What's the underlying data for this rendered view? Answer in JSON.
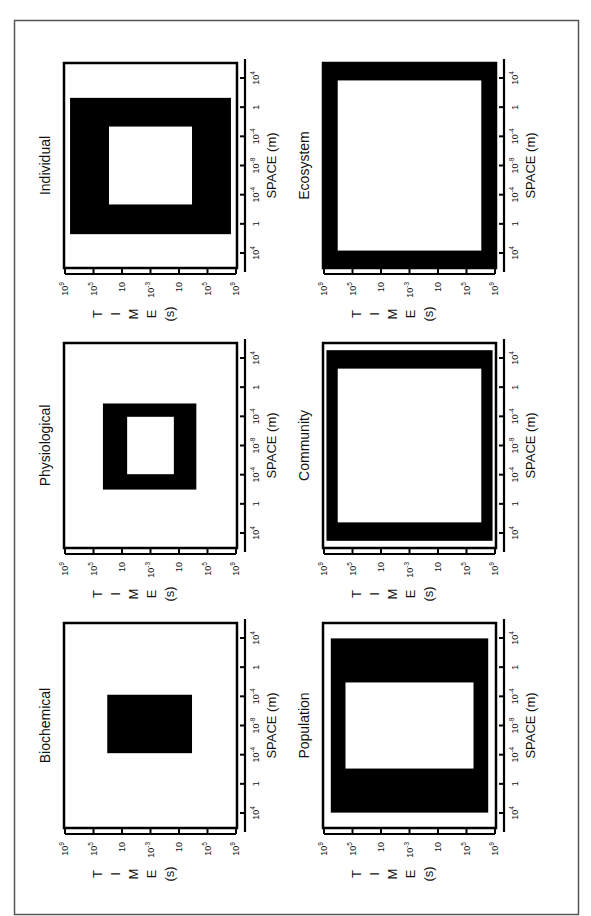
{
  "figure": {
    "orientation": "rotated-90-ccw",
    "frame_color": "#555555",
    "fill_color": "#000000",
    "background": "#ffffff"
  },
  "axes": {
    "time_label_letters": [
      "T",
      "I",
      "M",
      "E",
      "(s)"
    ],
    "time_label": "TIME (s)",
    "time_ticks": [
      {
        "base": "10",
        "exp": "9"
      },
      {
        "base": "10",
        "exp": "5"
      },
      {
        "base": "10",
        "exp": ""
      },
      {
        "base": "10",
        "exp": "-3"
      },
      {
        "base": "10",
        "exp": ""
      },
      {
        "base": "10",
        "exp": "5"
      },
      {
        "base": "10",
        "exp": "9"
      }
    ],
    "space_label": "SPACE (m)",
    "space_ticks": [
      {
        "base": "10",
        "exp": "4"
      },
      {
        "base": "1",
        "exp": ""
      },
      {
        "base": "10",
        "exp": "-4"
      },
      {
        "base": "10",
        "exp": "-8"
      },
      {
        "base": "10",
        "exp": "-4"
      },
      {
        "base": "1",
        "exp": ""
      },
      {
        "base": "10",
        "exp": "4"
      }
    ]
  },
  "panels": [
    {
      "title": "Individual",
      "col": 0,
      "row": 0,
      "outer": {
        "t0": 0.035,
        "t1": 0.965,
        "s0": 0.17,
        "s1": 0.835
      },
      "inner": {
        "t0": 0.26,
        "t1": 0.74,
        "s0": 0.31,
        "s1": 0.69
      }
    },
    {
      "title": "Physiological",
      "col": 0,
      "row": 1,
      "outer": {
        "t0": 0.225,
        "t1": 0.765,
        "s0": 0.295,
        "s1": 0.715
      },
      "inner": {
        "t0": 0.365,
        "t1": 0.635,
        "s0": 0.36,
        "s1": 0.64
      }
    },
    {
      "title": "Biochemical",
      "col": 0,
      "row": 2,
      "outer": {
        "t0": 0.25,
        "t1": 0.74,
        "s0": 0.35,
        "s1": 0.635
      },
      "inner": null
    },
    {
      "title": "Ecosystem",
      "col": 1,
      "row": 0,
      "outer": {
        "t0": 0.0,
        "t1": 1.0,
        "s0": 0.0,
        "s1": 1.0
      },
      "inner": {
        "t0": 0.085,
        "t1": 0.915,
        "s0": 0.085,
        "s1": 0.915
      }
    },
    {
      "title": "Community",
      "col": 1,
      "row": 1,
      "outer": {
        "t0": 0.02,
        "t1": 0.98,
        "s0": 0.035,
        "s1": 0.965
      },
      "inner": {
        "t0": 0.085,
        "t1": 0.915,
        "s0": 0.125,
        "s1": 0.875
      }
    },
    {
      "title": "Population",
      "col": 1,
      "row": 2,
      "outer": {
        "t0": 0.045,
        "t1": 0.955,
        "s0": 0.075,
        "s1": 0.925
      },
      "inner": {
        "t0": 0.13,
        "t1": 0.87,
        "s0": 0.29,
        "s1": 0.71
      }
    }
  ],
  "chart_data": {
    "type": "diagram",
    "xlabel": "SPACE (m)",
    "ylabel": "TIME (s)",
    "x_tick_labels": [
      "10^4",
      "1",
      "10^-4",
      "10^-8",
      "10^-4",
      "1",
      "10^4"
    ],
    "y_tick_labels": [
      "10^9",
      "10^5",
      "10",
      "10^-3",
      "10",
      "10^5",
      "10^9"
    ],
    "panels": [
      "Biochemical",
      "Physiological",
      "Individual",
      "Population",
      "Community",
      "Ecosystem"
    ]
  }
}
